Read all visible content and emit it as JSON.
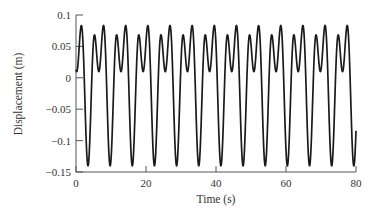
{
  "chart_data": {
    "type": "line",
    "title": "",
    "xlabel": "Time (s)",
    "ylabel": "Displacement (m)",
    "xlim": [
      0,
      80
    ],
    "ylim": [
      -0.15,
      0.1
    ],
    "grid": false,
    "legend": null,
    "x_ticks": [
      0,
      20,
      40,
      60,
      80
    ],
    "x_tick_labels": [
      "0",
      "20",
      "40",
      "60",
      "80"
    ],
    "y_ticks": [
      0.1,
      0.05,
      0,
      -0.05,
      -0.1,
      -0.15
    ],
    "y_tick_labels": [
      "0.1",
      "0.05",
      "0",
      "−0.05",
      "−0.1",
      "−0.15"
    ],
    "series": [
      {
        "name": "displacement",
        "color": "#1a1a1a",
        "description": "Periodic two-harmonic oscillation; deep minima about -0.14 every ~6.33 s (first near t=3.4 s); between minima a lower peak (~0.07), a shallow dip (~0.01) and a higher peak (~0.085)",
        "model": {
          "form": "x(t) = a0 - b1*cos(th) - b2*cos(2*th) - d*sin(th), th = 2*pi*(t - t0)/T",
          "a0": 0.0,
          "b1": 0.075,
          "b2": 0.065,
          "d": 0.0078,
          "T": 6.33,
          "t0": 3.4
        },
        "t_start": 0,
        "t_end": 80,
        "key_points": {
          "start_value": 0.016,
          "end_value": -0.085,
          "minima_t": [
            3.4,
            9.7,
            16.1,
            22.4,
            28.7,
            35.1,
            41.4,
            47.7,
            54.0,
            60.4,
            66.7,
            73.0,
            79.4
          ],
          "minima_value": -0.14,
          "high_peak_value": 0.085,
          "low_peak_value": 0.07,
          "dip_value": 0.01
        }
      }
    ]
  }
}
